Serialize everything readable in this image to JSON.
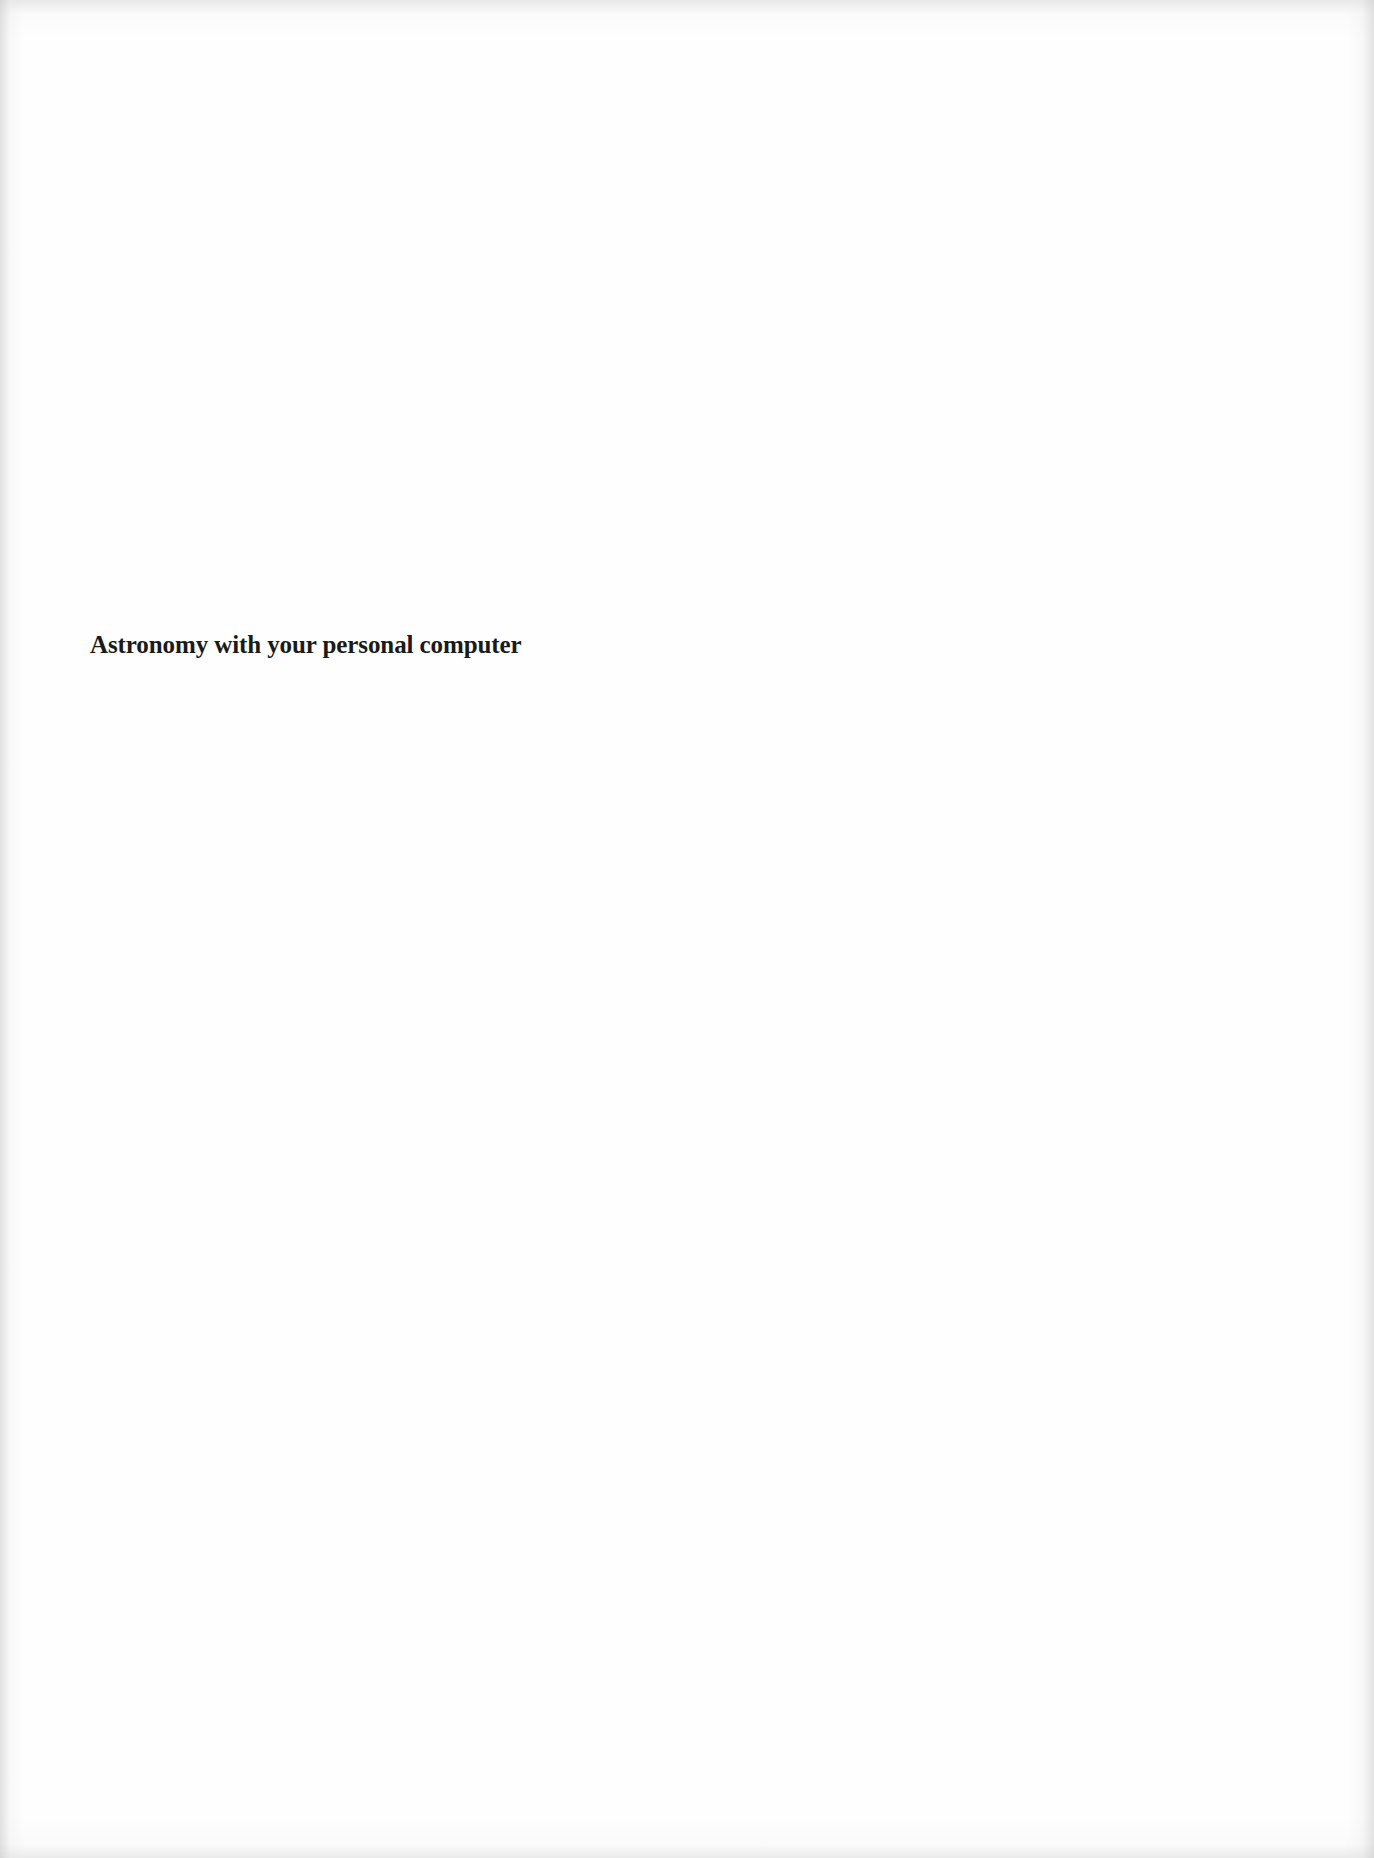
{
  "document": {
    "title": "Astronomy with your personal computer"
  },
  "colors": {
    "background": "#fefefe",
    "text": "#1a1a1a"
  }
}
